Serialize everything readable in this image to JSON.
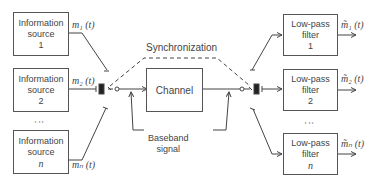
{
  "sources": [
    {
      "line1": "Information",
      "line2": "source",
      "index": "1",
      "signal": "m₁ (t)"
    },
    {
      "line1": "Information",
      "line2": "source",
      "index": "2",
      "signal": "m₂ (t)"
    },
    {
      "line1": "Information",
      "line2": "source",
      "index": "n",
      "signal": "mₙ (t)"
    }
  ],
  "filters": [
    {
      "line1": "Low-pass",
      "line2": "filter",
      "index": "1",
      "signal": "m̃₁ (t)"
    },
    {
      "line1": "Low-pass",
      "line2": "filter",
      "index": "2",
      "signal": "m̃₂ (t)"
    },
    {
      "line1": "Low-pass",
      "line2": "filter",
      "index": "n",
      "signal": "m̃ₙ (t)"
    }
  ],
  "channel": {
    "label": "Channel"
  },
  "synchronization": {
    "label": "Synchronization"
  },
  "baseband": {
    "line1": "Baseband",
    "line2": "signal"
  },
  "ellipsis": "⋮"
}
